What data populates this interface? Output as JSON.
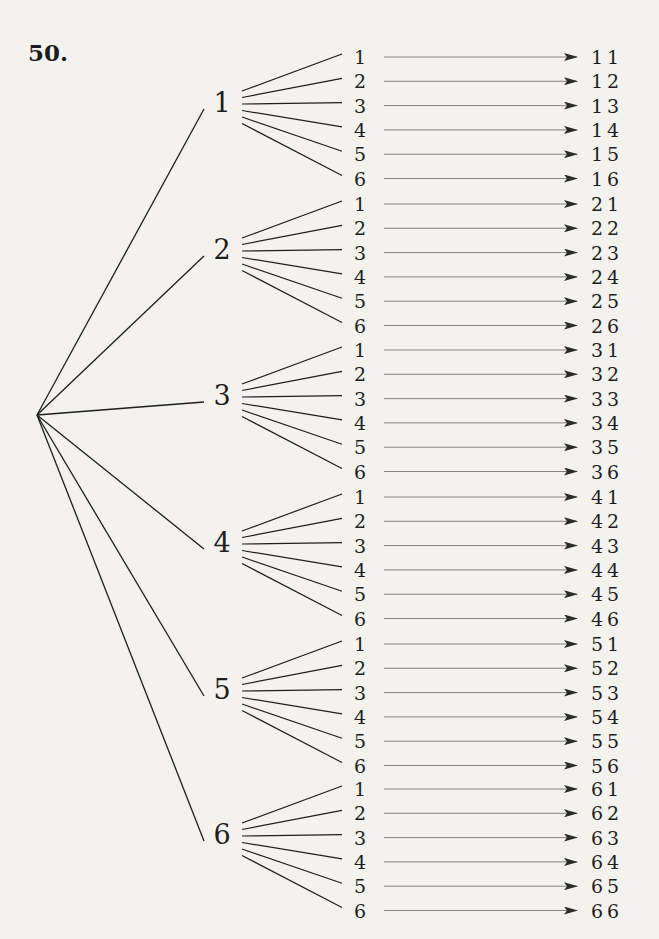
{
  "problem_number": "50.",
  "tree": {
    "root": {
      "x": 37,
      "y": 415
    },
    "first_level": [
      {
        "label": "1",
        "y": 101
      },
      {
        "label": "2",
        "y": 248
      },
      {
        "label": "3",
        "y": 394
      },
      {
        "label": "4",
        "y": 541
      },
      {
        "label": "5",
        "y": 688
      },
      {
        "label": "6",
        "y": 833
      }
    ],
    "second_level_labels": [
      "1",
      "2",
      "3",
      "4",
      "5",
      "6"
    ],
    "outcomes": [
      [
        "11",
        "12",
        "13",
        "14",
        "15",
        "16"
      ],
      [
        "21",
        "22",
        "23",
        "24",
        "25",
        "26"
      ],
      [
        "31",
        "32",
        "33",
        "34",
        "35",
        "36"
      ],
      [
        "41",
        "42",
        "43",
        "44",
        "45",
        "46"
      ],
      [
        "51",
        "52",
        "53",
        "54",
        "55",
        "56"
      ],
      [
        "61",
        "62",
        "63",
        "64",
        "65",
        "66"
      ]
    ]
  },
  "colors": {
    "background": "#f3f2ee",
    "ink": "#1e1e1e",
    "arrow": "#555555"
  }
}
